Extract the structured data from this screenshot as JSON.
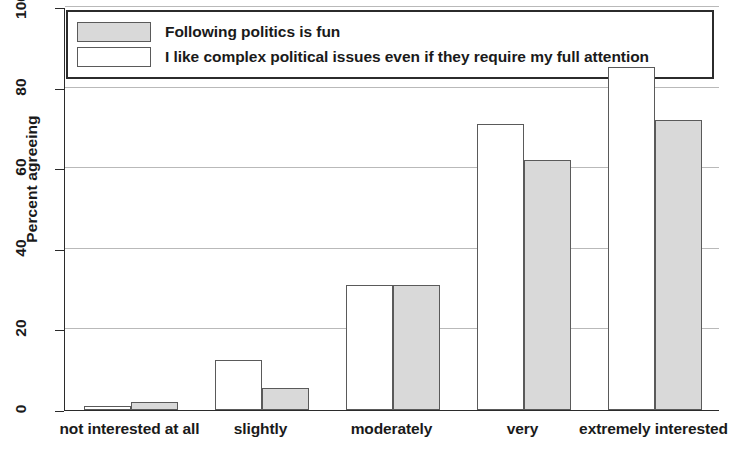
{
  "chart_data": {
    "type": "bar",
    "title": "",
    "subtitle": "",
    "xlabel": "",
    "ylabel": "Percent agreeing",
    "ylim": [
      0,
      100
    ],
    "yticks": [
      0,
      20,
      40,
      60,
      80,
      100
    ],
    "grid": true,
    "legend_position": "top-inside",
    "orientation": "vertical",
    "group_mode": "grouped",
    "categories": [
      "not interested at all",
      "slightly",
      "moderately",
      "very",
      "extremely interested"
    ],
    "series": [
      {
        "name": "I like complex political issues even if they require my full attention",
        "fill": "#ffffff",
        "edge": "#5a5a5a",
        "style_key": "series-white",
        "values": [
          1,
          12.5,
          31,
          71,
          85
        ]
      },
      {
        "name": "Following politics is fun",
        "fill": "#d9d9d9",
        "edge": "#5a5a5a",
        "style_key": "series-gray",
        "values": [
          2,
          5.5,
          31,
          62,
          72
        ]
      }
    ]
  },
  "legend": {
    "entries": [
      {
        "label": "Following politics is fun",
        "swatch": "sw-gray"
      },
      {
        "label": "I like complex political issues even if they require my full attention",
        "swatch": "sw-white"
      }
    ]
  },
  "axes": {
    "y_title": "Percent agreeing",
    "y_tick_labels": [
      "0",
      "20",
      "40",
      "60",
      "80",
      "100"
    ],
    "x_tick_labels": [
      "not interested at all",
      "slightly",
      "moderately",
      "very",
      "extremely interested"
    ]
  },
  "colors": {
    "series_gray_fill": "#d9d9d9",
    "series_white_fill": "#ffffff",
    "bar_edge": "#5a5a5a",
    "axis": "#2b2b2b",
    "gridline": "#b9b9b9",
    "background": "#ffffff",
    "text": "#1a1a1a"
  }
}
